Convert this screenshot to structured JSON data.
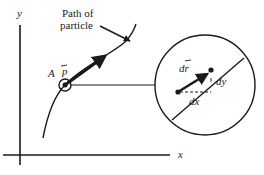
{
  "diagram": {
    "axes": {
      "x_label": "x",
      "y_label": "y"
    },
    "labels": {
      "path": [
        "Path of",
        "particle"
      ],
      "point": "A",
      "momentum_vector": "p",
      "displacement_vector": "dr",
      "dx": "dx",
      "dy": "dy"
    },
    "colors": {
      "ink": "#1a1a1a",
      "background": "#ffffff"
    }
  }
}
